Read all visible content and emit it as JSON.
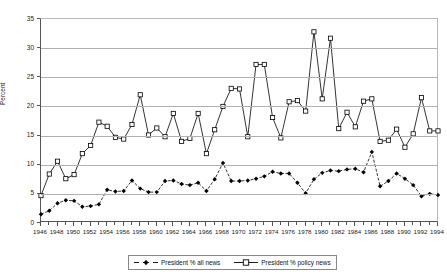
{
  "chart_data": {
    "type": "line",
    "title": "",
    "xlabel": "",
    "ylabel": "Percent",
    "xlim": [
      1946,
      1994
    ],
    "ylim": [
      0,
      35
    ],
    "ytick_step": 5,
    "xtick_step": 2,
    "grid": true,
    "legend_position": "bottom",
    "yticks": [
      0,
      5,
      10,
      15,
      20,
      25,
      30,
      35
    ],
    "xticks": [
      1946,
      1948,
      1950,
      1952,
      1954,
      1956,
      1958,
      1960,
      1962,
      1964,
      1966,
      1968,
      1970,
      1972,
      1974,
      1976,
      1978,
      1980,
      1982,
      1984,
      1986,
      1988,
      1990,
      1992,
      1994
    ],
    "x": [
      1946,
      1947,
      1948,
      1949,
      1950,
      1951,
      1952,
      1953,
      1954,
      1955,
      1956,
      1957,
      1958,
      1959,
      1960,
      1961,
      1962,
      1963,
      1964,
      1965,
      1966,
      1967,
      1968,
      1969,
      1970,
      1971,
      1972,
      1973,
      1974,
      1975,
      1976,
      1977,
      1978,
      1979,
      1980,
      1981,
      1982,
      1983,
      1984,
      1985,
      1986,
      1987,
      1988,
      1989,
      1990,
      1991,
      1992,
      1993,
      1994
    ],
    "series": [
      {
        "name": "President % all news",
        "marker": "filled-diamond",
        "line": "dashed",
        "color": "#000000",
        "values": [
          1.5,
          2.1,
          3.4,
          3.9,
          3.8,
          2.8,
          2.9,
          3.2,
          5.7,
          5.4,
          5.5,
          7.3,
          5.9,
          5.3,
          5.3,
          7.2,
          7.3,
          6.7,
          6.5,
          6.9,
          5.5,
          7.5,
          10.3,
          7.2,
          7.2,
          7.3,
          7.6,
          8.0,
          8.8,
          8.5,
          8.5,
          6.9,
          5.1,
          7.5,
          8.6,
          9.0,
          8.9,
          9.2,
          9.3,
          8.7,
          12.2,
          6.3,
          7.2,
          8.5,
          7.6,
          6.5,
          4.6,
          5.0,
          4.8
        ]
      },
      {
        "name": "President % policy news",
        "marker": "open-square",
        "line": "solid",
        "color": "#000000",
        "values": [
          4.7,
          8.4,
          10.6,
          7.6,
          8.3,
          11.9,
          13.3,
          17.3,
          16.6,
          14.7,
          14.4,
          16.9,
          22.0,
          15.1,
          16.3,
          14.8,
          18.8,
          14.0,
          14.5,
          18.8,
          11.9,
          16.0,
          20.0,
          23.1,
          23.0,
          14.8,
          27.2,
          27.2,
          18.1,
          14.6,
          20.8,
          21.0,
          19.2,
          32.8,
          21.3,
          31.7,
          16.2,
          19.0,
          16.5,
          20.9,
          21.3,
          14.0,
          14.2,
          16.1,
          13.0,
          15.3,
          21.5,
          15.8,
          15.8
        ]
      }
    ]
  },
  "legend": {
    "entries": [
      {
        "label": "President % all news"
      },
      {
        "label": "President % policy news"
      }
    ]
  }
}
